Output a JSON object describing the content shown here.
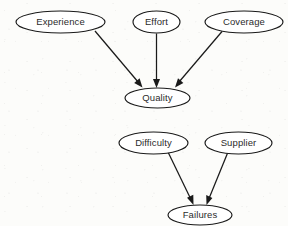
{
  "diagram": {
    "background_color": "#fcfcfa",
    "stroke_color": "#1a1a1a",
    "node_fill_color": "#ffffff",
    "label_color": "#2b2b2b",
    "graphs": [
      {
        "name": "quality-graph",
        "target": "Quality",
        "parents": [
          "Experience",
          "Effort",
          "Coverage"
        ]
      },
      {
        "name": "failures-graph",
        "target": "Failures",
        "parents": [
          "Difficulty",
          "Supplier"
        ]
      }
    ],
    "nodes": [
      {
        "id": "experience",
        "label": "Experience",
        "cx": 60.5,
        "cy": 22,
        "rx": 44.5,
        "ry": 11
      },
      {
        "id": "effort",
        "label": "Effort",
        "cx": 156.5,
        "cy": 22,
        "rx": 23.5,
        "ry": 11
      },
      {
        "id": "coverage",
        "label": "Coverage",
        "cx": 244,
        "cy": 22,
        "rx": 39,
        "ry": 11
      },
      {
        "id": "quality",
        "label": "Quality",
        "cx": 157.5,
        "cy": 98,
        "rx": 32.5,
        "ry": 10
      },
      {
        "id": "difficulty",
        "label": "Difficulty",
        "cx": 153.5,
        "cy": 143,
        "rx": 34.5,
        "ry": 11
      },
      {
        "id": "supplier",
        "label": "Supplier",
        "cx": 238.5,
        "cy": 143,
        "rx": 33.5,
        "ry": 11
      },
      {
        "id": "failures",
        "label": "Failures",
        "cx": 200,
        "cy": 215,
        "rx": 32,
        "ry": 10
      }
    ],
    "edges": [
      {
        "id": "experience-to-quality",
        "from": "Experience",
        "to": "Quality"
      },
      {
        "id": "effort-to-quality",
        "from": "Effort",
        "to": "Quality"
      },
      {
        "id": "coverage-to-quality",
        "from": "Coverage",
        "to": "Quality"
      },
      {
        "id": "difficulty-to-failures",
        "from": "Difficulty",
        "to": "Failures"
      },
      {
        "id": "supplier-to-failures",
        "from": "Supplier",
        "to": "Failures"
      }
    ]
  }
}
